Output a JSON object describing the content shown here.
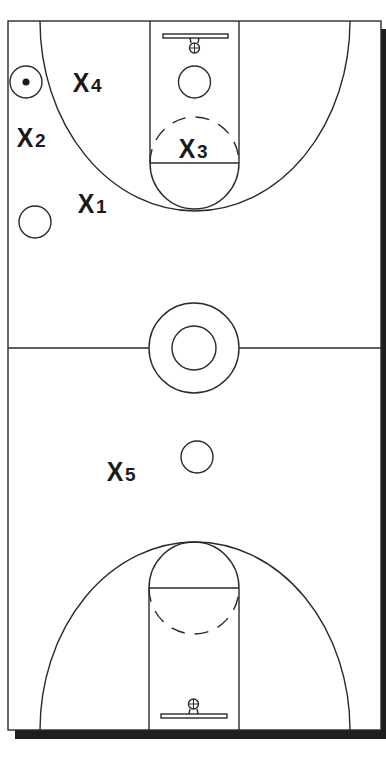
{
  "diagram": {
    "colors": {
      "line": "#2a2a2a",
      "shadow": "#1e1e1e",
      "background": "#ffffff"
    },
    "players": [
      {
        "id": "x1",
        "letter": "X",
        "number": "1",
        "x": 78,
        "y": 192
      },
      {
        "id": "x2",
        "letter": "X",
        "number": "2",
        "x": 17,
        "y": 126
      },
      {
        "id": "x3",
        "letter": "X",
        "number": "3",
        "x": 179,
        "y": 136
      },
      {
        "id": "x4",
        "letter": "X",
        "number": "4",
        "x": 73,
        "y": 72
      },
      {
        "id": "x5",
        "letter": "X",
        "number": "5",
        "x": 107,
        "y": 460
      }
    ],
    "offense_markers": [
      {
        "id": "o-ball",
        "x": 26,
        "y": 83,
        "has_ball": true
      },
      {
        "id": "o-left-wing",
        "x": 35,
        "y": 222,
        "has_ball": false
      },
      {
        "id": "o-high-post",
        "x": 195,
        "y": 82,
        "has_ball": false
      },
      {
        "id": "o-center",
        "x": 197,
        "y": 457,
        "has_ball": false
      }
    ]
  }
}
